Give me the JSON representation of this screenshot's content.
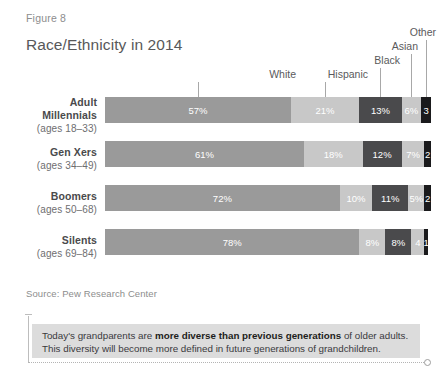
{
  "header": {
    "figure_label": "Figure 8",
    "title": "Race/Ethnicity in 2014"
  },
  "source": "Source: Pew Research Center",
  "callout": {
    "line1_pre": "Today's grandparents are ",
    "line1_bold": "more diverse than previous generations",
    "line1_post": " of older adults.",
    "line2": "This diversity will become more defined in future generations of grandchildren."
  },
  "legend": {
    "items": [
      {
        "label": "White",
        "color": "#9a9a9a"
      },
      {
        "label": "Hispanic",
        "color": "#c8c8c8"
      },
      {
        "label": "Black",
        "color": "#4a4a4c"
      },
      {
        "label": "Asian",
        "color": "#c8c8c8"
      },
      {
        "label": "Other",
        "color": "#1a1a1c"
      }
    ]
  },
  "rows": [
    {
      "name": "Adult Millennials",
      "name_line1": "Adult",
      "name_line2": "Millennials",
      "ages": "(ages 18–33)"
    },
    {
      "name": "Gen Xers",
      "name_line1": "Gen Xers",
      "name_line2": "",
      "ages": "(ages 34–49)"
    },
    {
      "name": "Boomers",
      "name_line1": "Boomers",
      "name_line2": "",
      "ages": "(ages 50–68)"
    },
    {
      "name": "Silents",
      "name_line1": "Silents",
      "name_line2": "",
      "ages": "(ages 69–84)"
    }
  ],
  "chart_data": {
    "type": "bar",
    "orientation": "horizontal",
    "stacked": true,
    "normalized_percent": true,
    "title": "Race/Ethnicity in 2014",
    "xlabel": "",
    "ylabel": "",
    "xlim": [
      0,
      100
    ],
    "grid": false,
    "legend_position": "top-right-callouts",
    "categories": [
      "Adult Millennials (ages 18–33)",
      "Gen Xers (ages 34–49)",
      "Boomers (ages 50–68)",
      "Silents (ages 69–84)"
    ],
    "series": [
      {
        "name": "White",
        "color": "#9a9a9a",
        "values": [
          57,
          61,
          72,
          78
        ],
        "labels": [
          "57%",
          "61%",
          "72%",
          "78%"
        ]
      },
      {
        "name": "Hispanic",
        "color": "#c8c8c8",
        "values": [
          21,
          18,
          10,
          8
        ],
        "labels": [
          "21%",
          "18%",
          "10%",
          "8%"
        ]
      },
      {
        "name": "Black",
        "color": "#4a4a4c",
        "values": [
          13,
          12,
          11,
          8
        ],
        "labels": [
          "13%",
          "12%",
          "11%",
          "8%"
        ]
      },
      {
        "name": "Asian",
        "color": "#c8c8c8",
        "values": [
          6,
          7,
          5,
          4
        ],
        "labels": [
          "6%",
          "7%",
          "5%",
          "4"
        ]
      },
      {
        "name": "Other",
        "color": "#1a1a1c",
        "values": [
          3,
          2,
          2,
          1
        ],
        "labels": [
          "3",
          "2",
          "2",
          "1"
        ]
      }
    ],
    "annotations": [
      "Today's grandparents are more diverse than previous generations of older adults.",
      "This diversity will become more defined in future generations of grandchildren."
    ],
    "source": "Pew Research Center"
  }
}
